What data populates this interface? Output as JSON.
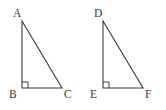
{
  "figure": {
    "background_color": "#ffffff",
    "stroke_color": "#3a3a3a",
    "label_color": "#3a3a3a"
  },
  "triangles": [
    {
      "name": "triangle-abc",
      "vertices": [
        {
          "label": "A",
          "x": 22,
          "y": 21,
          "label_x": 13,
          "label_y": 8
        },
        {
          "label": "B",
          "x": 22,
          "y": 88,
          "label_x": 9,
          "label_y": 89
        },
        {
          "label": "C",
          "x": 62,
          "y": 88,
          "label_x": 64,
          "label_y": 89
        }
      ],
      "right_angle_at": "B",
      "right_angle_marker": {
        "x": 22,
        "y": 88,
        "size": 6
      }
    },
    {
      "name": "triangle-def",
      "vertices": [
        {
          "label": "D",
          "x": 103,
          "y": 21,
          "label_x": 94,
          "label_y": 8
        },
        {
          "label": "E",
          "x": 103,
          "y": 88,
          "label_x": 90,
          "label_y": 89
        },
        {
          "label": "F",
          "x": 143,
          "y": 88,
          "label_x": 145,
          "label_y": 89
        }
      ],
      "right_angle_at": "E",
      "right_angle_marker": {
        "x": 103,
        "y": 88,
        "size": 6
      }
    }
  ],
  "chart_data": {
    "type": "diagram",
    "title": "",
    "shapes": [
      {
        "id": "ABC",
        "kind": "right-triangle",
        "points": [
          [
            22,
            21
          ],
          [
            22,
            88
          ],
          [
            62,
            88
          ]
        ],
        "labels": [
          "A",
          "B",
          "C"
        ],
        "legs": {
          "vertical": 67,
          "horizontal": 40
        },
        "right_angle_vertex": "B"
      },
      {
        "id": "DEF",
        "kind": "right-triangle",
        "points": [
          [
            103,
            21
          ],
          [
            103,
            88
          ],
          [
            143,
            88
          ]
        ],
        "labels": [
          "D",
          "E",
          "F"
        ],
        "legs": {
          "vertical": 67,
          "horizontal": 40
        },
        "right_angle_vertex": "E"
      }
    ]
  }
}
